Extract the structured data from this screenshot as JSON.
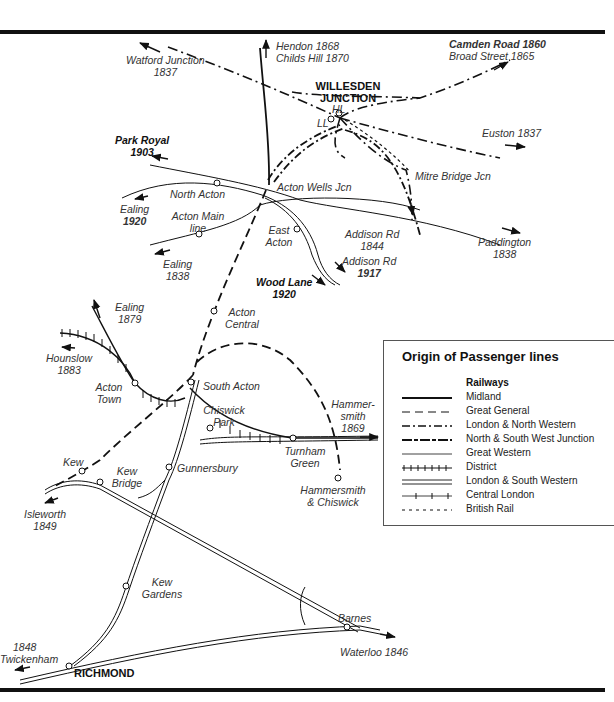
{
  "map": {
    "junction_title": "WILLESDEN JUNCTION",
    "stations": {
      "hl": "HL",
      "ll": "LL",
      "north_acton": "North Acton",
      "acton_main_line": "Acton Main line",
      "east_acton": "East Acton",
      "acton_central": "Acton Central",
      "south_acton": "South Acton",
      "acton_town": "Acton Town",
      "chiswick_park": "Chiswick Park",
      "turnham_green": "Turnham Green",
      "gunnersbury": "Gunnersbury",
      "kew": "Kew",
      "kew_bridge": "Kew Bridge",
      "kew_gardens": "Kew Gardens",
      "barnes": "Barnes",
      "richmond": "RICHMOND",
      "hammersmith_chiswick": "Hammersmith & Chiswick"
    },
    "junctions": {
      "acton_wells": "Acton Wells Jcn",
      "mitre_bridge": "Mitre Bridge Jcn"
    },
    "destinations": {
      "watford_name": "Watford Junction",
      "watford_year": "1837",
      "hendon": "Hendon 1868",
      "childs_hill": "Childs Hill 1870",
      "camden_road": "Camden Road 1860",
      "broad_street": "Broad Street 1865",
      "euston": "Euston 1837",
      "park_royal_name": "Park Royal",
      "park_royal_year": "1903",
      "ealing1920_name": "Ealing",
      "ealing1920_year": "1920",
      "ealing1838_name": "Ealing",
      "ealing1838_year": "1838",
      "ealing1879_name": "Ealing",
      "ealing1879_year": "1879",
      "addison1844_name": "Addison Rd",
      "addison1844_year": "1844",
      "addison1917_name": "Addison Rd",
      "addison1917_year": "1917",
      "wood_lane_name": "Wood Lane",
      "wood_lane_year": "1920",
      "paddington_name": "Paddington",
      "paddington_year": "1838",
      "hounslow_name": "Hounslow",
      "hounslow_year": "1883",
      "hammersmith_name": "Hammer-smith",
      "hammersmith_year": "1869",
      "isleworth_name": "Isleworth",
      "isleworth_year": "1849",
      "twickenham_year": "1848",
      "twickenham_name": "Twickenham",
      "waterloo": "Waterloo 1846"
    }
  },
  "legend": {
    "title": "Origin of Passenger lines",
    "subtitle": "Railways",
    "items": [
      {
        "label": "Midland",
        "style": "thick-solid"
      },
      {
        "label": "Great General",
        "style": "long-dash"
      },
      {
        "label": "London & North Western",
        "style": "dash-dot"
      },
      {
        "label": "North & South West Junction",
        "style": "dash-dot-heavy"
      },
      {
        "label": "Great Western",
        "style": "thin-solid"
      },
      {
        "label": "District",
        "style": "ticked"
      },
      {
        "label": "London & South Western",
        "style": "double-line"
      },
      {
        "label": "Central London",
        "style": "sparse-ticked"
      },
      {
        "label": "British Rail",
        "style": "short-dash"
      }
    ]
  },
  "colors": {
    "ink": "#111111",
    "text": "#333333",
    "background": "#ffffff"
  }
}
